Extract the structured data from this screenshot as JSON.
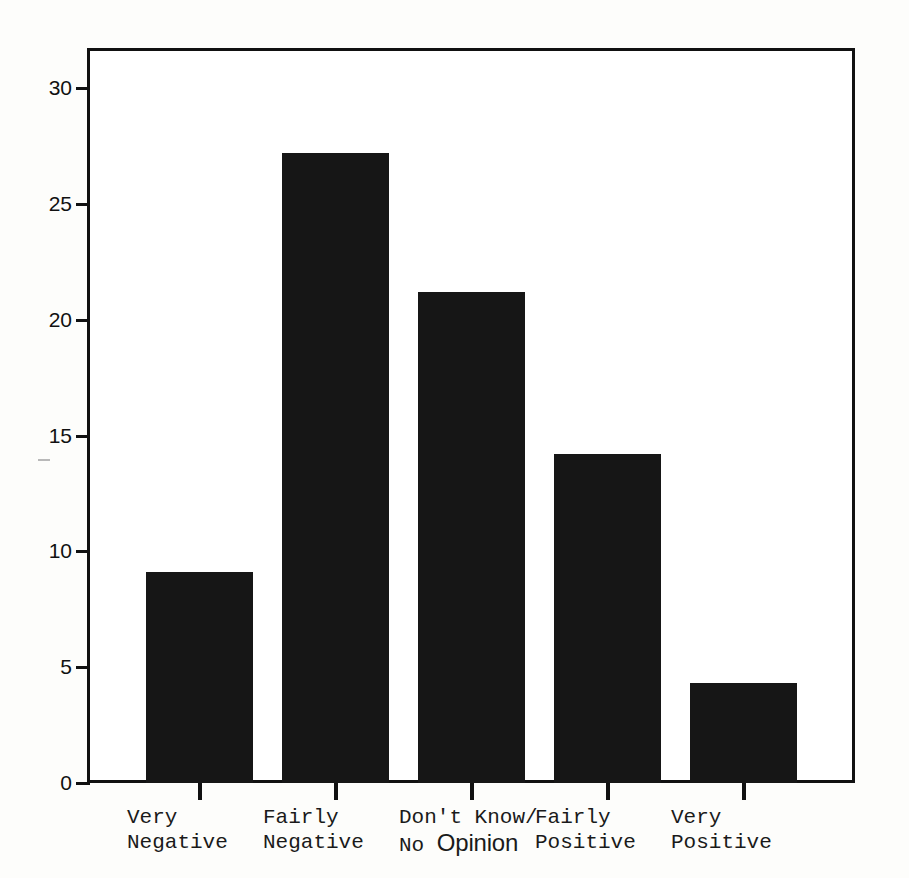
{
  "chart_data": {
    "type": "bar",
    "title": "",
    "subtitle": "",
    "xlabel": "",
    "ylabel": "",
    "categories": [
      "Very Negative",
      "Fairly Negative",
      "Don't Know/ No Opinion",
      "Fairly Positive",
      "Very Positive"
    ],
    "category_lines": [
      {
        "line1": "Very",
        "line2": "Negative"
      },
      {
        "line1": "Fairly",
        "line2": "Negative"
      },
      {
        "line1": "Don't Know/",
        "line2_prefix": "No ",
        "line2_emphasis": "Opinion"
      },
      {
        "line1": "Fairly",
        "line2": "Positive"
      },
      {
        "line1": "Very",
        "line2": "Positive"
      }
    ],
    "values": [
      9.1,
      27.2,
      21.2,
      14.2,
      4.3
    ],
    "ylim": [
      0,
      31
    ],
    "yticks": [
      0,
      5,
      10,
      15,
      20,
      25,
      30
    ],
    "ytick_labels": [
      "0",
      "5",
      "10",
      "15",
      "20",
      "25",
      "30"
    ],
    "grid": false,
    "legend": null,
    "bar_color": "#161616",
    "axis_color": "#111111",
    "background_color": "#ffffff"
  }
}
